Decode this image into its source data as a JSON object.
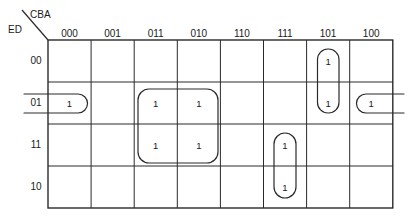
{
  "map": {
    "title": "Karnaugh Map",
    "column_variables": "CBA",
    "row_variables": "ED",
    "column_headers": [
      "000",
      "001",
      "011",
      "010",
      "110",
      "111",
      "101",
      "100"
    ],
    "row_headers": [
      "00",
      "01",
      "11",
      "10"
    ],
    "cell_one": "1",
    "cells": [
      {
        "row": "00",
        "col": "101",
        "value": "1"
      },
      {
        "row": "01",
        "col": "000",
        "value": "1"
      },
      {
        "row": "01",
        "col": "011",
        "value": "1"
      },
      {
        "row": "01",
        "col": "010",
        "value": "1"
      },
      {
        "row": "01",
        "col": "101",
        "value": "1"
      },
      {
        "row": "01",
        "col": "100",
        "value": "1"
      },
      {
        "row": "11",
        "col": "011",
        "value": "1"
      },
      {
        "row": "11",
        "col": "010",
        "value": "1"
      },
      {
        "row": "11",
        "col": "111",
        "value": "1"
      },
      {
        "row": "10",
        "col": "111",
        "value": "1"
      }
    ],
    "groups": [
      {
        "name": "wrap-around-row-01",
        "style": "wrap-horizontal",
        "rows": [
          "01"
        ],
        "cols": [
          "000",
          "100"
        ],
        "cell_count": 2
      },
      {
        "name": "block-011-010-rows-01-11",
        "style": "rectangle",
        "rows": [
          "01",
          "11"
        ],
        "cols": [
          "011",
          "010"
        ],
        "cell_count": 4
      },
      {
        "name": "column-101-rows-00-01",
        "style": "capsule-vertical",
        "rows": [
          "00",
          "01"
        ],
        "cols": [
          "101"
        ],
        "cell_count": 2
      },
      {
        "name": "column-111-rows-11-10",
        "style": "capsule-vertical",
        "rows": [
          "11",
          "10"
        ],
        "cols": [
          "111"
        ],
        "cell_count": 2
      }
    ]
  },
  "colors": {
    "line": "#2a2a2a",
    "text": "#1a1a1a",
    "background": "#ffffff"
  }
}
